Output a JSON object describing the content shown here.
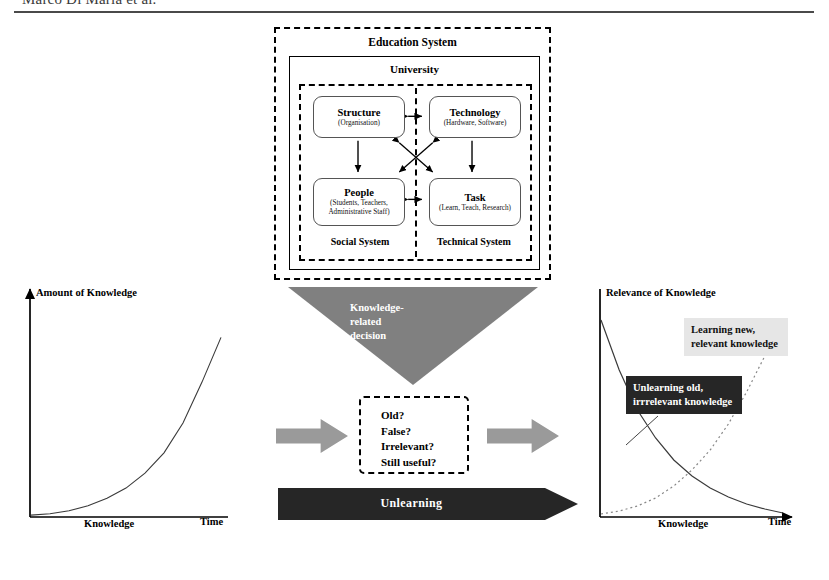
{
  "page": {
    "running_header": "Marco Di Maria et al."
  },
  "education_system": {
    "title": "Education System",
    "university_title": "University",
    "social_system_label": "Social System",
    "technical_system_label": "Technical System",
    "nodes": [
      {
        "title": "Structure",
        "subtitle": "(Organisation)"
      },
      {
        "title": "Technology",
        "subtitle": "(Hardware, Software)"
      },
      {
        "title": "People",
        "subtitle": "(Students, Teachers, Administrative Staff)"
      },
      {
        "title": "Task",
        "subtitle": "(Learn, Teach, Research)"
      }
    ]
  },
  "decision": {
    "label": "Knowledge-\nrelated\ndecision"
  },
  "questions": {
    "items": [
      "Old?",
      "False?",
      "Irrelevant?",
      "Still useful?"
    ]
  },
  "unlearning_band": {
    "label": "Unlearning"
  },
  "annotations": {
    "learning": "Learning new, relevant knowledge",
    "unlearning": "Unlearning old, irrrelevant knowledge"
  },
  "colors": {
    "decision_gray": "#808080",
    "arrow_gray": "#9a9a9a",
    "band_black": "#262626",
    "anno_light": "#e6e6e6"
  },
  "chart_data": [
    {
      "id": "amount-of-knowledge",
      "type": "line",
      "title": "",
      "ylabel": "Amount of Knowledge",
      "xlabel": "Knowledge",
      "xlabel_end": "Time",
      "grid": false,
      "legend": "none",
      "xlim": [
        0,
        10
      ],
      "ylim": [
        0,
        10
      ],
      "series": [
        {
          "name": "Amount of knowledge",
          "style": "solid",
          "x": [
            0,
            1,
            2,
            3,
            4,
            5,
            6,
            7,
            8,
            9,
            10
          ],
          "y": [
            0.05,
            0.12,
            0.28,
            0.55,
            0.95,
            1.5,
            2.3,
            3.4,
            5.0,
            7.2,
            9.6
          ]
        }
      ]
    },
    {
      "id": "relevance-of-knowledge",
      "type": "line",
      "title": "",
      "ylabel": "Relevance of Knowledge",
      "xlabel": "Knowledge",
      "xlabel_end": "Time",
      "grid": false,
      "legend": "none",
      "xlim": [
        0,
        10
      ],
      "ylim": [
        0,
        10
      ],
      "series": [
        {
          "name": "Unlearning old, irrrelevant knowledge",
          "style": "solid",
          "x": [
            0,
            1,
            2,
            3,
            4,
            5,
            6,
            7,
            8,
            9,
            10
          ],
          "y": [
            9.8,
            7.3,
            5.3,
            3.9,
            2.8,
            2.0,
            1.4,
            0.95,
            0.6,
            0.35,
            0.15
          ]
        },
        {
          "name": "Learning new, relevant knowledge",
          "style": "dotted",
          "x": [
            0,
            1,
            2,
            3,
            4,
            5,
            6,
            7,
            8,
            9,
            10
          ],
          "y": [
            0.1,
            0.25,
            0.5,
            0.9,
            1.5,
            2.3,
            3.3,
            4.6,
            6.2,
            8.0,
            9.8
          ]
        }
      ]
    }
  ]
}
